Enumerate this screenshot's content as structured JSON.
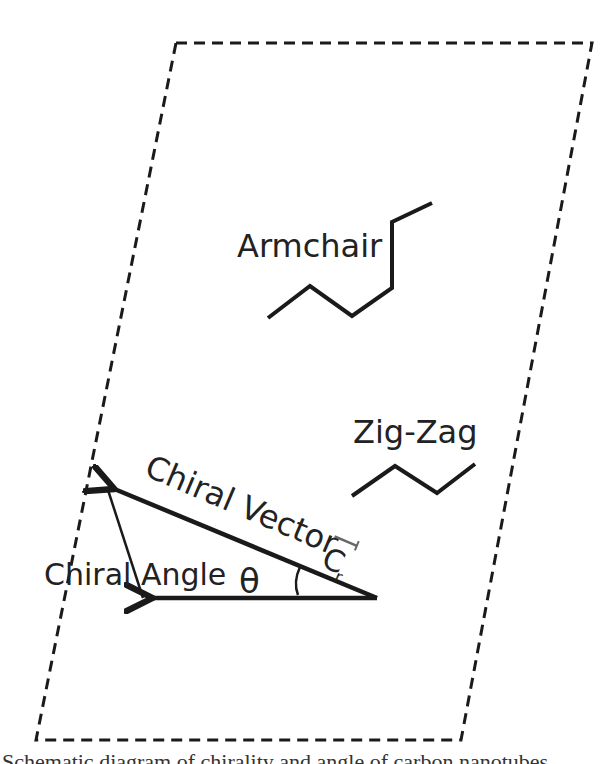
{
  "diagram": {
    "colors": {
      "ink": "#1a1a1a",
      "text": "#222222",
      "background": "#ffffff"
    },
    "labels": {
      "armchair": "Armchair",
      "zigzag": "Zig-Zag",
      "chiral_vector": "Chiral Vector",
      "chiral_vector_symbol": "C",
      "chiral_vector_subscript": "r",
      "chiral_angle": "Chiral Angle",
      "theta": "θ"
    },
    "shapes": {
      "unit_cell": "dashed parallelogram",
      "armchair_edge": "polyline",
      "zigzag_edge": "polyline",
      "chiral_vector_arrow": "thick arrow",
      "reference_arrow": "thick arrow",
      "chiral_angle_arc": "arc"
    }
  },
  "caption": {
    "text": "Schematic diagram of chirality and angle of carbon nanotubes"
  }
}
